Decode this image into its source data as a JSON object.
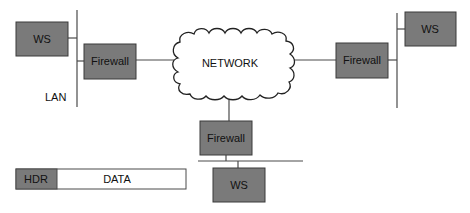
{
  "diagram": {
    "network_label": "NETWORK",
    "lan_label": "LAN",
    "nodes": {
      "ws_left": "WS",
      "ws_right": "WS",
      "ws_bottom": "WS",
      "firewall_left": "Firewall",
      "firewall_right": "Firewall",
      "firewall_bottom": "Firewall"
    },
    "packet": {
      "header_label": "HDR",
      "data_label": "DATA"
    },
    "colors": {
      "box_fill": "#7a7a7a",
      "line": "#4a4a4a",
      "background": "#ffffff"
    }
  }
}
